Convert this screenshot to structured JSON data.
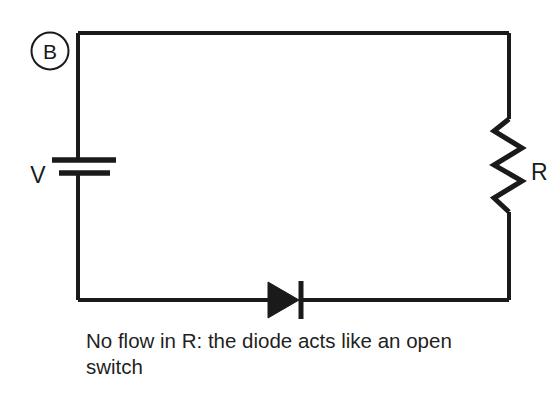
{
  "figure": {
    "panel_label": "B",
    "background_color": "#ffffff",
    "stroke_color": "#1a1a1a",
    "wire_width": 4
  },
  "circuit": {
    "name": "diode-reverse-biased-series-circuit",
    "components": [
      {
        "id": "battery",
        "type": "battery",
        "label": "V",
        "position": "left-branch"
      },
      {
        "id": "resistor",
        "type": "resistor",
        "label": "R",
        "position": "right-branch"
      },
      {
        "id": "diode",
        "type": "diode",
        "label": "",
        "position": "bottom-branch",
        "orientation": "points-right"
      }
    ],
    "wires": [
      {
        "id": "top-wire",
        "from": "top-left-corner",
        "to": "top-right-corner"
      },
      {
        "id": "left-wire",
        "from": "top-left-corner",
        "to": "bottom-left-corner"
      },
      {
        "id": "right-wire",
        "from": "top-right-corner",
        "to": "bottom-right-corner"
      },
      {
        "id": "bottom-wire",
        "from": "bottom-left-corner",
        "to": "bottom-right-corner"
      }
    ]
  },
  "caption": {
    "line1": "No flow in R: the diode acts like an open",
    "line2": "switch"
  }
}
